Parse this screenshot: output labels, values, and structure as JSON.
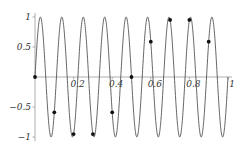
{
  "chart_data": {
    "type": "line",
    "title": "",
    "xlabel": "",
    "ylabel": "",
    "xlim": [
      0,
      1
    ],
    "ylim": [
      -1,
      1
    ],
    "grid": false,
    "legend": null,
    "x_ticks": [
      0.2,
      0.4,
      0.6,
      0.8,
      1
    ],
    "x_tick_labels": [
      "0.2",
      "0.4",
      "0.6",
      "0.8",
      "1"
    ],
    "y_ticks": [
      -1,
      -0.5,
      0.5,
      1
    ],
    "y_tick_labels": [
      "-1",
      "-0.5",
      "0.5",
      "1"
    ],
    "series": [
      {
        "name": "curve",
        "kind": "line",
        "function": "sin(18*pi*x)",
        "x_range": [
          0,
          1
        ],
        "cycles": 9,
        "color": "#555555"
      },
      {
        "name": "samples",
        "kind": "scatter",
        "x": [
          0,
          0.1,
          0.2,
          0.3,
          0.4,
          0.5,
          0.6,
          0.7,
          0.8,
          0.9
        ],
        "y": [
          0,
          -0.588,
          -0.951,
          -0.951,
          -0.588,
          0,
          0.588,
          0.951,
          0.951,
          0.588
        ],
        "color": "#111111"
      }
    ]
  }
}
